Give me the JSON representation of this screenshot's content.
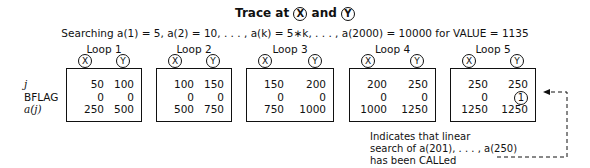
{
  "title": {
    "prefix": "Trace at",
    "x": "X",
    "and": "and",
    "y": "Y"
  },
  "subtitle": "Searching a(1) = 5, a(2) = 10, . . . , a(k) = 5∗k, . . . , a(2000) = 10000 for VALUE = 1135",
  "row_labels": [
    "j",
    "BFLAG",
    "a(j)"
  ],
  "loops": [
    {
      "label": "Loop 1",
      "x": [
        "50",
        "0",
        "250"
      ],
      "y": [
        "100",
        "0",
        "500"
      ]
    },
    {
      "label": "Loop 2",
      "x": [
        "100",
        "0",
        "500"
      ],
      "y": [
        "150",
        "0",
        "750"
      ]
    },
    {
      "label": "Loop 3",
      "x": [
        "150",
        "0",
        "750"
      ],
      "y": [
        "200",
        "0",
        "1000"
      ]
    },
    {
      "label": "Loop 4",
      "x": [
        "200",
        "0",
        "1000"
      ],
      "y": [
        "250",
        "0",
        "1250"
      ]
    },
    {
      "label": "Loop 5",
      "x": [
        "250",
        "0",
        "1250"
      ],
      "y": [
        "250",
        "1",
        "1250"
      ]
    }
  ],
  "markers": {
    "x": "X",
    "y": "Y"
  },
  "note": [
    "Indicates that linear",
    "search of a(201), . . . , a(250)",
    "has been CALLed"
  ]
}
